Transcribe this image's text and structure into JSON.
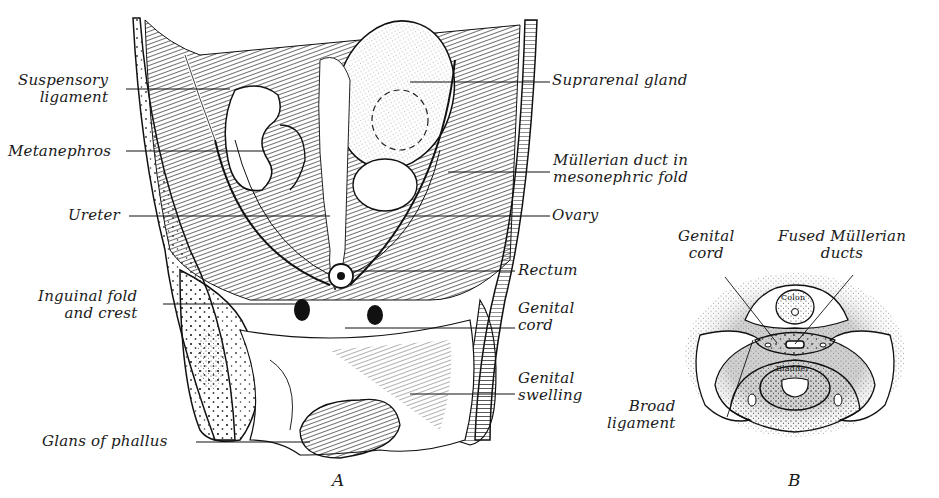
{
  "figure": {
    "panel_a": {
      "letter": "A",
      "labels_left": [
        {
          "line1": "Suspensory",
          "line2": "ligament"
        },
        {
          "line1": "Metanephros"
        },
        {
          "line1": "Ureter"
        },
        {
          "line1": "Inguinal fold",
          "line2": "and crest"
        },
        {
          "line1": "Glans of phallus"
        }
      ],
      "labels_right": [
        {
          "line1": "Suprarenal gland"
        },
        {
          "line1": "Müllerian duct in",
          "line2": "mesonephric fold"
        },
        {
          "line1": "Ovary"
        },
        {
          "line1": "Rectum"
        },
        {
          "line1": "Genital",
          "line2": "cord"
        },
        {
          "line1": "Genital",
          "line2": "swelling"
        }
      ]
    },
    "panel_b": {
      "letter": "B",
      "labels": {
        "genital_cord": {
          "line1": "Genital",
          "line2": "cord"
        },
        "fused_mullerian": {
          "line1": "Fused Müllerian",
          "line2": "ducts"
        },
        "broad_ligament": {
          "line1": "Broad",
          "line2": "ligament"
        },
        "colon": "Colon",
        "bladder": "Bladder"
      }
    }
  }
}
